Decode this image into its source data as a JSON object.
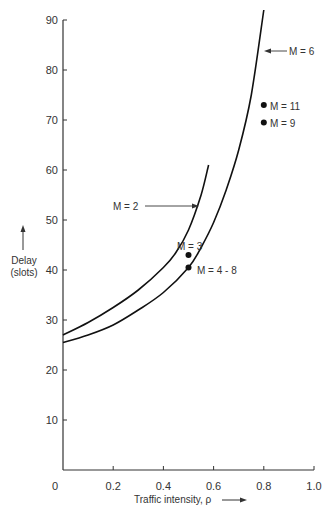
{
  "chart_data": {
    "type": "line",
    "title": "",
    "xlabel": "Traffic intensity, ρ",
    "ylabel": "Delay (slots)",
    "xlim": [
      0,
      1.0
    ],
    "ylim": [
      0,
      90
    ],
    "grid": false,
    "x_ticks": [
      "0",
      "0.2",
      "0.4",
      "0.6",
      "0.8",
      "1.0"
    ],
    "y_ticks": [
      "10",
      "20",
      "30",
      "40",
      "50",
      "60",
      "70",
      "80",
      "90"
    ],
    "series": [
      {
        "name": "M = 2",
        "kind": "curve",
        "x": [
          0,
          0.1,
          0.2,
          0.3,
          0.4,
          0.45,
          0.5,
          0.55,
          0.58
        ],
        "y": [
          27,
          29.5,
          32.5,
          36,
          40.5,
          43.5,
          48,
          55,
          61
        ]
      },
      {
        "name": "M = 6",
        "kind": "curve",
        "x": [
          0,
          0.1,
          0.2,
          0.3,
          0.4,
          0.5,
          0.55,
          0.6,
          0.65,
          0.7,
          0.75,
          0.8
        ],
        "y": [
          25.5,
          27,
          29,
          32,
          35.5,
          40.5,
          44.5,
          49.5,
          56,
          64,
          75,
          92
        ]
      },
      {
        "name": "M = 3",
        "kind": "point",
        "x": [
          0.5
        ],
        "y": [
          43
        ]
      },
      {
        "name": "M = 4 - 8",
        "kind": "point",
        "x": [
          0.5
        ],
        "y": [
          40.5
        ]
      },
      {
        "name": "M = 11",
        "kind": "point",
        "x": [
          0.8
        ],
        "y": [
          73
        ]
      },
      {
        "name": "M = 9",
        "kind": "point",
        "x": [
          0.8
        ],
        "y": [
          69.5
        ]
      }
    ],
    "annotations": [
      {
        "text": "M = 2",
        "points_to": "M = 2 curve",
        "arrow": true
      },
      {
        "text": "M = 6",
        "points_to": "M = 6 curve",
        "arrow": true
      },
      {
        "text": "M = 3"
      },
      {
        "text": "M = 4 - 8"
      },
      {
        "text": "M = 11"
      },
      {
        "text": "M = 9"
      }
    ]
  },
  "labels": {
    "y_axis_line1": "Delay",
    "y_axis_line2": "(slots)",
    "x_axis": "Traffic intensity, ρ",
    "origin": "0",
    "m2": "M = 2",
    "m6": "M = 6",
    "m3": "M = 3",
    "m48": "M = 4 - 8",
    "m11": "M = 11",
    "m9": "M = 9"
  }
}
